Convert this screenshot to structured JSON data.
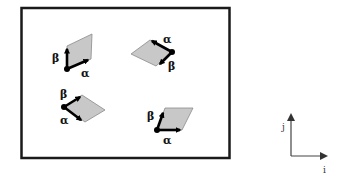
{
  "diagram": {
    "colors": {
      "frame": "#1a1a1a",
      "shape_fill": "#c8c8c8",
      "shape_stroke": "#8a8a8a",
      "arrow": "#000000",
      "axis": "#444444"
    },
    "shapes": [
      {
        "id": "top-left",
        "alpha_label": "α",
        "beta_label": "β"
      },
      {
        "id": "top-right",
        "alpha_label": "α",
        "beta_label": "β"
      },
      {
        "id": "bottom-left",
        "alpha_label": "α",
        "beta_label": "β"
      },
      {
        "id": "bottom-right",
        "alpha_label": "α",
        "beta_label": "β"
      }
    ],
    "axes": {
      "x_label": "i",
      "y_label": "j"
    }
  }
}
